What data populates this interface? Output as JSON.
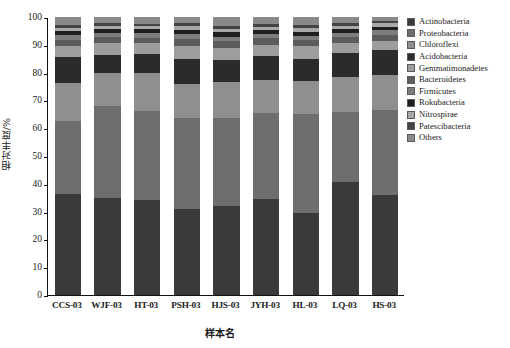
{
  "chart_data": {
    "type": "bar",
    "subtype": "stacked-bar-100-percent",
    "title": "",
    "xlabel": "样本名",
    "ylabel": "相对丰度/%",
    "ylim": [
      0,
      100
    ],
    "yticks": [
      0,
      10,
      20,
      30,
      40,
      50,
      60,
      70,
      80,
      90,
      100
    ],
    "grid": false,
    "legend_position": "right",
    "categories": [
      "CCS-03",
      "WJF-03",
      "HT-03",
      "PSH-03",
      "HJS-03",
      "JYH-03",
      "HL-03",
      "LQ-03",
      "HS-03"
    ],
    "series": [
      {
        "name": "Actinobacteria",
        "color": "#3a3a3a",
        "values": [
          36.5,
          35.0,
          34.5,
          31.0,
          32.0,
          34.5,
          29.5,
          40.5,
          36.0
        ]
      },
      {
        "name": "Proteobacteria",
        "color": "#6e6e6e",
        "values": [
          26.0,
          33.0,
          32.5,
          32.8,
          31.5,
          31.0,
          35.5,
          25.5,
          30.5
        ]
      },
      {
        "name": "Chloroflexi",
        "color": "#8f8f8f",
        "values": [
          13.8,
          12.0,
          13.5,
          12.2,
          13.0,
          12.0,
          12.0,
          12.5,
          12.5
        ]
      },
      {
        "name": "Acidobacteria",
        "color": "#2b2b2b",
        "values": [
          9.2,
          6.5,
          7.0,
          9.0,
          8.0,
          8.5,
          8.0,
          8.5,
          9.0
        ]
      },
      {
        "name": "Gemmatimonadetes",
        "color": "#9d9d9d",
        "values": [
          4.0,
          4.0,
          4.0,
          4.5,
          4.5,
          4.0,
          4.5,
          3.5,
          3.5
        ]
      },
      {
        "name": "Bacteroidetes",
        "color": "#5c5c5c",
        "values": [
          2.3,
          2.2,
          2.0,
          2.5,
          2.4,
          2.3,
          2.2,
          2.3,
          2.2
        ]
      },
      {
        "name": "Firmicutes",
        "color": "#7d7d7d",
        "values": [
          1.6,
          1.5,
          1.5,
          1.8,
          1.6,
          1.5,
          1.6,
          1.5,
          1.5
        ]
      },
      {
        "name": "Rokubacteria",
        "color": "#1f1f1f",
        "values": [
          1.6,
          1.5,
          1.5,
          1.6,
          1.5,
          1.6,
          1.5,
          1.5,
          1.4
        ]
      },
      {
        "name": "Nitrospirae",
        "color": "#a8a8a8",
        "values": [
          1.2,
          1.2,
          1.1,
          1.3,
          1.2,
          1.2,
          1.2,
          1.1,
          1.1
        ]
      },
      {
        "name": "Patescibacteria",
        "color": "#444444",
        "values": [
          1.0,
          1.0,
          1.0,
          1.1,
          1.1,
          1.0,
          1.0,
          1.0,
          1.0
        ]
      },
      {
        "name": "Others",
        "color": "#8a8a8a",
        "values": [
          2.8,
          2.1,
          2.4,
          2.2,
          3.2,
          2.4,
          3.0,
          2.1,
          1.3
        ]
      }
    ]
  },
  "axis": {
    "y_title": "相对丰度/%",
    "x_title": "样本名",
    "y_tick_labels": [
      "0",
      "10",
      "20",
      "30",
      "40",
      "50",
      "60",
      "70",
      "80",
      "90",
      "100"
    ],
    "x_tick_labels": [
      "CCS-03",
      "WJF-03",
      "HT-03",
      "PSH-03",
      "HJS-03",
      "JYH-03",
      "HL-03",
      "LQ-03",
      "HS-03"
    ]
  },
  "legend": {
    "items": [
      {
        "label": "Actinobacteria",
        "color": "#3a3a3a"
      },
      {
        "label": "Proteobacteria",
        "color": "#6e6e6e"
      },
      {
        "label": "Chloroflexi",
        "color": "#8f8f8f"
      },
      {
        "label": "Acidobacteria",
        "color": "#2b2b2b"
      },
      {
        "label": "Gemmatimonadetes",
        "color": "#9d9d9d"
      },
      {
        "label": "Bacteroidetes",
        "color": "#5c5c5c"
      },
      {
        "label": "Firmicutes",
        "color": "#7d7d7d"
      },
      {
        "label": "Rokubacteria",
        "color": "#1f1f1f"
      },
      {
        "label": "Nitrospirae",
        "color": "#a8a8a8"
      },
      {
        "label": "Patescibacteria",
        "color": "#444444"
      },
      {
        "label": "Others",
        "color": "#8a8a8a"
      }
    ]
  }
}
